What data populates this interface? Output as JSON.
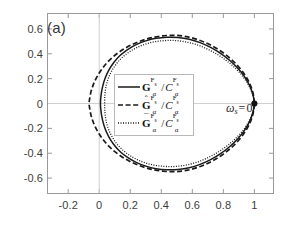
{
  "figure": {
    "panel_label": "(a)",
    "background_color": "#ffffff",
    "frame_color": "#8c8c8c",
    "curve_color": "#1a1a1a"
  },
  "annotation": {
    "omega_symbol": "ω",
    "omega_subscript": "s",
    "omega_equals": "=",
    "omega_value": "0",
    "marker_x": 1.0,
    "marker_y": 0.0,
    "marker_style": "filled-circle"
  },
  "legend": {
    "position": "center",
    "entries": [
      {
        "line_style": "solid",
        "symbol": "G",
        "accent": "none",
        "bold": true,
        "subscript": "α",
        "superscript": "F",
        "superscript_sub": "s",
        "divider": "/",
        "denominator_symbol": "C",
        "denominator_subscript": "α",
        "denominator_superscript": "F",
        "denominator_superscript_sub": "s",
        "label": "G_a^{F_s}/C_a^{F_s}"
      },
      {
        "line_style": "dashed",
        "symbol": "G",
        "accent": "hat",
        "bold": true,
        "subscript": "α",
        "superscript": "F",
        "superscript_sub": "s",
        "divider": "/",
        "denominator_symbol": "C",
        "denominator_subscript": "α",
        "denominator_superscript": "F",
        "denominator_superscript_sub": "s",
        "label": "Ĥ_a^{F_s}/C_a^{F_s}"
      },
      {
        "line_style": "dotted",
        "symbol": "G",
        "accent": "bar",
        "bold": true,
        "subscript": "α",
        "superscript": "F",
        "superscript_sub": "s",
        "divider": "/",
        "denominator_symbol": "C",
        "denominator_subscript": "α",
        "denominator_superscript": "F",
        "denominator_superscript_sub": "s",
        "label": "Ḡ_a^{F_s}/C_a^{F_s}"
      }
    ]
  },
  "chart_data": {
    "type": "line",
    "title": "",
    "subtitle": "",
    "xlabel": "",
    "ylabel": "",
    "xlim": [
      -0.33,
      1.12
    ],
    "ylim": [
      -0.72,
      0.72
    ],
    "grid": false,
    "legend_position": "center",
    "x_ticks": [
      -0.2,
      0,
      0.2,
      0.4,
      0.6,
      0.8,
      1
    ],
    "x_tick_labels": [
      "-0.2",
      "0",
      "0.2",
      "0.4",
      "0.6",
      "0.8",
      "1"
    ],
    "y_ticks": [
      -0.6,
      -0.4,
      -0.2,
      0,
      0.2,
      0.4,
      0.6
    ],
    "y_tick_labels": [
      "-0.6",
      "-0.4",
      "-0.2",
      "0",
      "0.2",
      "0.4",
      "0.6"
    ],
    "annotations": [
      {
        "text": "ω_s = 0",
        "x": 1.0,
        "y": 0.0,
        "marker": "filled-circle"
      },
      {
        "text": "(a)",
        "x": -0.28,
        "y": 0.64,
        "marker": "none"
      }
    ],
    "series": [
      {
        "name": "G_a^{F_s}/C_a^{F_s}",
        "style": "solid",
        "description": "Closed Nyquist-like loop from (1,0) bulging left to about x=0.0, peak y about 0.53",
        "points": [
          [
            1.0,
            0.0
          ],
          [
            0.99,
            0.075
          ],
          [
            0.968,
            0.148
          ],
          [
            0.935,
            0.218
          ],
          [
            0.892,
            0.285
          ],
          [
            0.84,
            0.348
          ],
          [
            0.782,
            0.404
          ],
          [
            0.718,
            0.452
          ],
          [
            0.65,
            0.49
          ],
          [
            0.58,
            0.517
          ],
          [
            0.508,
            0.531
          ],
          [
            0.436,
            0.533
          ],
          [
            0.366,
            0.524
          ],
          [
            0.3,
            0.504
          ],
          [
            0.238,
            0.474
          ],
          [
            0.183,
            0.434
          ],
          [
            0.134,
            0.386
          ],
          [
            0.094,
            0.33
          ],
          [
            0.062,
            0.268
          ],
          [
            0.038,
            0.203
          ],
          [
            0.022,
            0.136
          ],
          [
            0.012,
            0.068
          ],
          [
            0.008,
            0.0
          ],
          [
            0.012,
            -0.068
          ],
          [
            0.022,
            -0.136
          ],
          [
            0.038,
            -0.203
          ],
          [
            0.062,
            -0.268
          ],
          [
            0.094,
            -0.33
          ],
          [
            0.134,
            -0.386
          ],
          [
            0.183,
            -0.434
          ],
          [
            0.238,
            -0.474
          ],
          [
            0.3,
            -0.504
          ],
          [
            0.366,
            -0.524
          ],
          [
            0.436,
            -0.533
          ],
          [
            0.508,
            -0.531
          ],
          [
            0.58,
            -0.517
          ],
          [
            0.65,
            -0.49
          ],
          [
            0.718,
            -0.452
          ],
          [
            0.782,
            -0.404
          ],
          [
            0.84,
            -0.348
          ],
          [
            0.892,
            -0.285
          ],
          [
            0.935,
            -0.218
          ],
          [
            0.968,
            -0.148
          ],
          [
            0.99,
            -0.075
          ],
          [
            1.0,
            0.0
          ]
        ]
      },
      {
        "name": "Ghat_a^{F_s}/C_a^{F_s}",
        "style": "dashed",
        "description": "Outermost loop; reaches leftmost x about -0.10, peak y about 0.545",
        "points": [
          [
            1.0,
            0.0
          ],
          [
            0.992,
            0.078
          ],
          [
            0.972,
            0.155
          ],
          [
            0.94,
            0.228
          ],
          [
            0.897,
            0.298
          ],
          [
            0.845,
            0.362
          ],
          [
            0.785,
            0.42
          ],
          [
            0.718,
            0.47
          ],
          [
            0.646,
            0.509
          ],
          [
            0.571,
            0.536
          ],
          [
            0.494,
            0.548
          ],
          [
            0.416,
            0.545
          ],
          [
            0.34,
            0.53
          ],
          [
            0.267,
            0.503
          ],
          [
            0.198,
            0.466
          ],
          [
            0.136,
            0.42
          ],
          [
            0.081,
            0.366
          ],
          [
            0.035,
            0.306
          ],
          [
            -0.002,
            0.241
          ],
          [
            -0.031,
            0.173
          ],
          [
            -0.051,
            0.104
          ],
          [
            -0.062,
            0.035
          ],
          [
            -0.065,
            0.0
          ],
          [
            -0.062,
            -0.035
          ],
          [
            -0.051,
            -0.104
          ],
          [
            -0.031,
            -0.173
          ],
          [
            -0.002,
            -0.241
          ],
          [
            0.035,
            -0.306
          ],
          [
            0.081,
            -0.366
          ],
          [
            0.136,
            -0.42
          ],
          [
            0.198,
            -0.466
          ],
          [
            0.267,
            -0.503
          ],
          [
            0.34,
            -0.53
          ],
          [
            0.416,
            -0.545
          ],
          [
            0.494,
            -0.548
          ],
          [
            0.571,
            -0.536
          ],
          [
            0.646,
            -0.509
          ],
          [
            0.718,
            -0.47
          ],
          [
            0.785,
            -0.42
          ],
          [
            0.845,
            -0.362
          ],
          [
            0.897,
            -0.298
          ],
          [
            0.94,
            -0.228
          ],
          [
            0.972,
            -0.155
          ],
          [
            0.992,
            -0.078
          ],
          [
            1.0,
            0.0
          ]
        ]
      },
      {
        "name": "Gbar_a^{F_s}/C_a^{F_s}",
        "style": "dotted",
        "description": "Innermost loop; leftmost x about 0.03, peak y about 0.505",
        "points": [
          [
            1.0,
            0.0
          ],
          [
            0.989,
            0.072
          ],
          [
            0.965,
            0.142
          ],
          [
            0.931,
            0.209
          ],
          [
            0.887,
            0.272
          ],
          [
            0.834,
            0.331
          ],
          [
            0.775,
            0.384
          ],
          [
            0.711,
            0.429
          ],
          [
            0.644,
            0.466
          ],
          [
            0.575,
            0.491
          ],
          [
            0.505,
            0.505
          ],
          [
            0.436,
            0.507
          ],
          [
            0.369,
            0.499
          ],
          [
            0.306,
            0.481
          ],
          [
            0.248,
            0.453
          ],
          [
            0.196,
            0.417
          ],
          [
            0.151,
            0.373
          ],
          [
            0.113,
            0.323
          ],
          [
            0.083,
            0.267
          ],
          [
            0.06,
            0.207
          ],
          [
            0.045,
            0.143
          ],
          [
            0.037,
            0.074
          ],
          [
            0.035,
            0.0
          ],
          [
            0.037,
            -0.074
          ],
          [
            0.045,
            -0.143
          ],
          [
            0.06,
            -0.207
          ],
          [
            0.083,
            -0.267
          ],
          [
            0.113,
            -0.323
          ],
          [
            0.151,
            -0.373
          ],
          [
            0.196,
            -0.417
          ],
          [
            0.248,
            -0.453
          ],
          [
            0.306,
            -0.481
          ],
          [
            0.369,
            -0.499
          ],
          [
            0.436,
            -0.507
          ],
          [
            0.505,
            -0.505
          ],
          [
            0.575,
            -0.491
          ],
          [
            0.644,
            -0.466
          ],
          [
            0.711,
            -0.429
          ],
          [
            0.775,
            -0.384
          ],
          [
            0.834,
            -0.331
          ],
          [
            0.887,
            -0.272
          ],
          [
            0.931,
            -0.209
          ],
          [
            0.965,
            -0.142
          ],
          [
            0.989,
            -0.072
          ],
          [
            1.0,
            0.0
          ]
        ]
      }
    ]
  }
}
